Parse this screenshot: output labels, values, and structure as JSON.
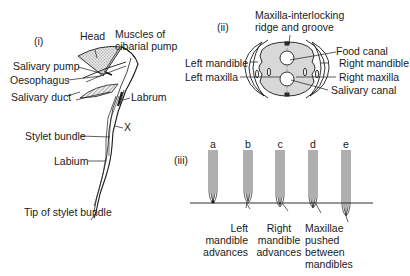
{
  "panel_i": {
    "label": "(i)",
    "head": "Head",
    "muscles": "Muscles of\ncibarial pump",
    "salivary_pump": "Salivary pump",
    "oesophagus": "Oesophagus",
    "salivary_duct": "Salivary duct",
    "labrum": "Labrum",
    "x_mark": "X",
    "stylet_bundle": "Stylet bundle",
    "labium": "Labium",
    "tip": "Tip of stylet bundle"
  },
  "panel_ii": {
    "label": "(ii)",
    "ridge": "Maxilla-interlocking\nridge and groove",
    "left_mandible": "Left mandible",
    "left_maxilla": "Left maxilla",
    "food_canal": "Food canal",
    "right_mandible": "Right mandible",
    "right_maxilla": "Right maxilla",
    "salivary_canal": "Salivary canal"
  },
  "panel_iii": {
    "label": "(iii)",
    "stages": [
      {
        "letter": "a",
        "caption": ""
      },
      {
        "letter": "b",
        "caption": "Left\nmandible\nadvances"
      },
      {
        "letter": "c",
        "caption": "Right\nmandible\nadvances"
      },
      {
        "letter": "d",
        "caption": "Maxillae\npushed\nbetween\nmandibles"
      },
      {
        "letter": "e",
        "caption": ""
      }
    ]
  },
  "colors": {
    "ink": "#1a1a1a",
    "shade": "#d4d4d4",
    "hatch": "#8a8a8a"
  }
}
